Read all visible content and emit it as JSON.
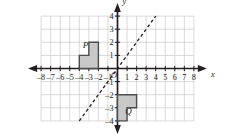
{
  "figure": {
    "type": "coordinate-plane",
    "axis_labels": {
      "x": "x",
      "y": "y",
      "origin": "O"
    },
    "grid": {
      "visible": true,
      "color": "#c9c9c9",
      "x_min": -8,
      "x_max": 8,
      "y_min": -4,
      "y_max": 4,
      "step": 1
    },
    "axes": {
      "color": "#231f20",
      "arrowheads": true
    },
    "x_tick_labels": [
      "-8",
      "-7",
      "-6",
      "-5",
      "-4",
      "-3",
      "-2",
      "-1",
      "1",
      "2",
      "3",
      "4",
      "5",
      "6",
      "7",
      "8"
    ],
    "x_tick_values": [
      -8,
      -7,
      -6,
      -5,
      -4,
      -3,
      -2,
      -1,
      1,
      2,
      3,
      4,
      5,
      6,
      7,
      8
    ],
    "y_tick_labels": [
      "4",
      "3",
      "2",
      "1",
      "-1",
      "-2",
      "-3",
      "-4"
    ],
    "y_tick_values": [
      4,
      3,
      2,
      1,
      -1,
      -2,
      -3,
      -4
    ],
    "line_of_reflection": {
      "name": "y-equals-x",
      "equation": "y = x",
      "style": "dashed",
      "color": "#231f20",
      "from": [
        -4,
        -4
      ],
      "to": [
        4,
        4
      ]
    },
    "shapes": [
      {
        "label": "P",
        "fill": "#c8c8c8",
        "stroke": "#4d4d4d",
        "label_point": [
          -3.35,
          1.55
        ],
        "vertices": [
          [
            -4,
            0
          ],
          [
            -2,
            0
          ],
          [
            -2,
            2
          ],
          [
            -3,
            2
          ],
          [
            -3,
            1
          ],
          [
            -4,
            1
          ]
        ]
      },
      {
        "label": "Q",
        "fill": "#c8c8c8",
        "stroke": "#4d4d4d",
        "label_point": [
          1.15,
          -3.45
        ],
        "vertices": [
          [
            0,
            -4
          ],
          [
            0,
            -2
          ],
          [
            2,
            -2
          ],
          [
            2,
            -3
          ],
          [
            1,
            -3
          ],
          [
            1,
            -4
          ]
        ]
      }
    ]
  }
}
